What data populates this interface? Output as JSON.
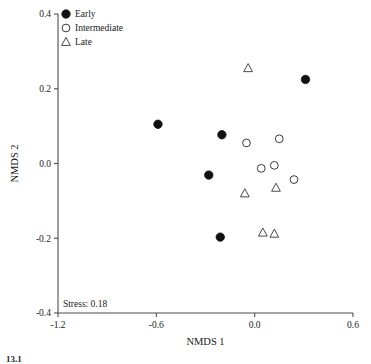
{
  "chart_data": {
    "type": "scatter",
    "title": "",
    "xlabel": "NMDS 1",
    "ylabel": "NMDS 2",
    "xlim": [
      -1.2,
      0.6
    ],
    "ylim": [
      -0.4,
      0.4
    ],
    "xticks": [
      "-1.2",
      "-0.6",
      "0.0",
      "0.6"
    ],
    "xtick_values": [
      -1.2,
      -0.6,
      0.0,
      0.6
    ],
    "yticks": [
      "0.4",
      "0.2",
      "0.0",
      "-0.2",
      "-0.4"
    ],
    "ytick_values": [
      0.4,
      0.2,
      0.0,
      -0.2,
      -0.4
    ],
    "grid": false,
    "legend_position": "top-left",
    "annotations": [
      {
        "text": "Stress: 0.18",
        "x": -1.17,
        "y": -0.385
      }
    ],
    "series": [
      {
        "name": "Early",
        "marker": "filled-circle",
        "color": "#111111",
        "points": [
          {
            "x": -0.59,
            "y": 0.105
          },
          {
            "x": 0.31,
            "y": 0.225
          },
          {
            "x": -0.2,
            "y": 0.077
          },
          {
            "x": -0.28,
            "y": -0.031
          },
          {
            "x": -0.21,
            "y": -0.197
          }
        ]
      },
      {
        "name": "Intermediate",
        "marker": "open-circle",
        "color": "#3a3a3a",
        "points": [
          {
            "x": -0.05,
            "y": 0.055
          },
          {
            "x": 0.15,
            "y": 0.066
          },
          {
            "x": 0.04,
            "y": -0.013
          },
          {
            "x": 0.12,
            "y": -0.005
          },
          {
            "x": 0.24,
            "y": -0.043
          }
        ]
      },
      {
        "name": "Late",
        "marker": "open-triangle",
        "color": "#4a4a4a",
        "points": [
          {
            "x": -0.04,
            "y": 0.255
          },
          {
            "x": -0.06,
            "y": -0.08
          },
          {
            "x": 0.13,
            "y": -0.065
          },
          {
            "x": 0.05,
            "y": -0.185
          },
          {
            "x": 0.12,
            "y": -0.188
          }
        ]
      }
    ]
  },
  "legend": {
    "items": [
      {
        "label": "Early",
        "marker": "filled-circle"
      },
      {
        "label": "Intermediate",
        "marker": "open-circle"
      },
      {
        "label": "Late",
        "marker": "open-triangle"
      }
    ]
  },
  "caption": {
    "text": "13.1"
  }
}
